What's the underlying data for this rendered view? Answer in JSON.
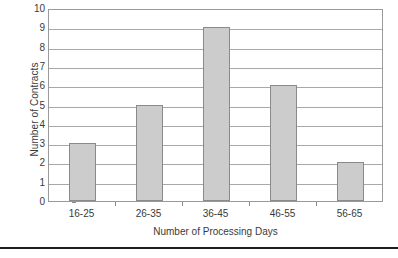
{
  "chart_data": {
    "type": "bar",
    "title": "",
    "subtitle": "",
    "categories": [
      "16-25",
      "26-35",
      "36-45",
      "46-55",
      "56-65"
    ],
    "values": [
      3,
      5,
      9,
      6,
      2
    ],
    "series": [
      {
        "name": "Number of Contracts",
        "values": [
          3,
          5,
          9,
          6,
          2
        ]
      }
    ],
    "xlabel": "Number of Processing Days",
    "ylabel": "Number of Contracts",
    "ylim": [
      0,
      10
    ],
    "ytick_labels": [
      "0",
      "1",
      "2",
      "3",
      "4",
      "5",
      "6",
      "7",
      "8",
      "9",
      "10"
    ],
    "ytick_values": [
      0,
      1,
      2,
      3,
      4,
      5,
      6,
      7,
      8,
      9,
      10
    ],
    "ytick_step": 1,
    "grid": true,
    "grid_axis": "y",
    "legend": false,
    "legend_position": "none",
    "annotations": [],
    "colors": {
      "bar_fill": "#cccccc",
      "bar_border": "#8a8a8a",
      "gridline": "#a8a8a8",
      "axis": "#9a9a9a",
      "text": "#3a3a3a",
      "background": "#ffffff",
      "footer_rule": "#1d1d1d"
    }
  }
}
